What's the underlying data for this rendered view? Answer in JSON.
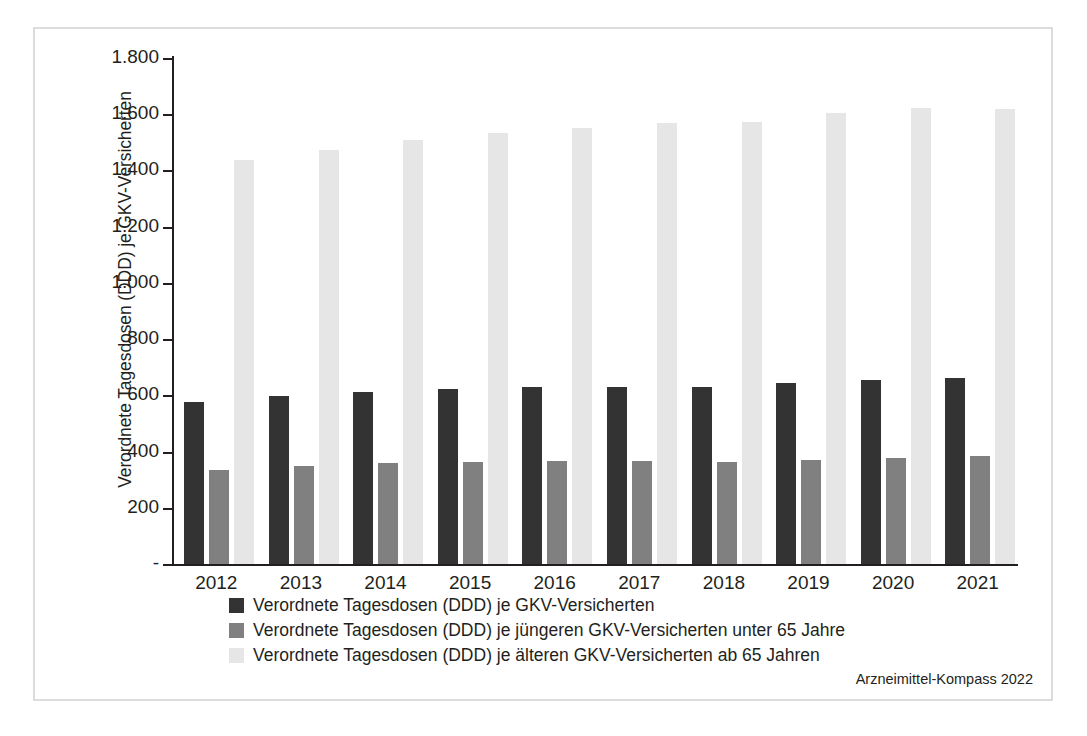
{
  "chart_data": {
    "type": "bar",
    "title": "",
    "subtitle": "",
    "xlabel": "",
    "ylabel": "Verordnete Tagesdosen (DDD) je GKV-Versicherten",
    "categories": [
      "2012",
      "2013",
      "2014",
      "2015",
      "2016",
      "2017",
      "2018",
      "2019",
      "2020",
      "2021"
    ],
    "series": [
      {
        "name": "Verordnete Tagesdosen (DDD) je GKV-Versicherten",
        "color": "#333333",
        "values": [
          578,
          598,
          612,
          621,
          628,
          631,
          629,
          643,
          654,
          661
        ]
      },
      {
        "name": "Verordnete Tagesdosen (DDD) je jüngeren GKV-Versicherten unter 65 Jahre",
        "color": "#808080",
        "values": [
          336,
          349,
          358,
          364,
          366,
          367,
          362,
          371,
          378,
          383
        ]
      },
      {
        "name": "Verordnete Tagesdosen (DDD) je älteren GKV-Versicherten ab 65 Jahren",
        "color": "#e6e6e6",
        "values": [
          1437,
          1474,
          1508,
          1533,
          1552,
          1570,
          1572,
          1603,
          1621,
          1619
        ]
      }
    ],
    "ylim": [
      0,
      1800
    ],
    "yticks": [
      0,
      200,
      400,
      600,
      800,
      1000,
      1200,
      1400,
      1600,
      1800
    ],
    "ytick_labels": [
      "-",
      "200",
      "400",
      "600",
      "800",
      "1.000",
      "1.200",
      "1.400",
      "1.600",
      "1.800"
    ],
    "grid": false,
    "legend_position": "bottom"
  },
  "source": "Arzneimittel-Kompass 2022"
}
